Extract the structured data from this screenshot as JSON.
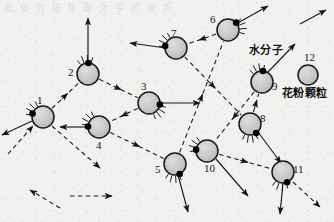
{
  "figure": {
    "background_color": "#f1f1f0",
    "particle_fill": "#c9c9c9",
    "particle_stroke": "#1a1a1a",
    "molecule_color": "#000000",
    "path_style": "dashed",
    "bleed_through_text": "此 处 为 纸 背 面 文 字 的 淡 影"
  },
  "annotations": [
    {
      "id": "water-molecule",
      "text": "水分子",
      "x": 249,
      "y": 45
    },
    {
      "id": "pollen-particle",
      "text": "花粉颗粒",
      "x": 282,
      "y": 88
    }
  ],
  "legend": {
    "pollen_label": "花粉颗粒",
    "pollen_number": "12",
    "water_label": "水分子"
  },
  "chart_data": {
    "type": "scatter",
    "xlabel": "",
    "ylabel": "",
    "xlim": [
      0,
      334
    ],
    "ylim": [
      0,
      222
    ],
    "grid": false,
    "legend_position": "top-right",
    "categories": [
      "1",
      "2",
      "3",
      "4",
      "5",
      "6",
      "7",
      "8",
      "9",
      "10",
      "11",
      "12"
    ],
    "positions": [
      {
        "n": "1",
        "x": 43,
        "y": 117,
        "r": 11,
        "label_dx": -2,
        "label_dy": -16,
        "dot_angle": 198,
        "kick_angle": 215
      },
      {
        "n": "2",
        "x": 88,
        "y": 74,
        "r": 11,
        "label_dx": -16,
        "label_dy": -1,
        "dot_angle": 272,
        "kick_angle": 258
      },
      {
        "n": "3",
        "x": 149,
        "y": 103,
        "r": 11,
        "label_dx": -4,
        "label_dy": -16,
        "dot_angle": 8,
        "kick_angle": 40
      },
      {
        "n": "4",
        "x": 99,
        "y": 127,
        "r": 11,
        "label_dx": 1,
        "label_dy": 19,
        "dot_angle": 182,
        "kick_angle": 215
      },
      {
        "n": "5",
        "x": 175,
        "y": 164,
        "r": 11,
        "label_dx": -16,
        "label_dy": 6,
        "dot_angle": 65,
        "kick_angle": 95
      },
      {
        "n": "6",
        "x": 228,
        "y": 30,
        "r": 11,
        "label_dx": -14,
        "label_dy": -10,
        "dot_angle": 318,
        "kick_angle": 345
      },
      {
        "n": "7",
        "x": 176,
        "y": 48,
        "r": 11,
        "label_dx": -1,
        "label_dy": -14,
        "dot_angle": 190,
        "kick_angle": 212
      },
      {
        "n": "8",
        "x": 250,
        "y": 124,
        "r": 11,
        "label_dx": 14,
        "label_dy": -5,
        "dot_angle": 56,
        "kick_angle": 88
      },
      {
        "n": "9",
        "x": 262,
        "y": 82,
        "r": 11,
        "label_dx": 14,
        "label_dy": 5,
        "dot_angle": 275,
        "kick_angle": 250
      },
      {
        "n": "10",
        "x": 207,
        "y": 151,
        "r": 11,
        "label_dx": 1,
        "label_dy": 18,
        "dot_angle": 187,
        "kick_angle": 205
      },
      {
        "n": "11",
        "x": 283,
        "y": 172,
        "r": 11,
        "label_dx": 14,
        "label_dy": -2,
        "dot_angle": 68,
        "kick_angle": 100
      },
      {
        "n": "12",
        "x": 308,
        "y": 75,
        "r": 10,
        "label_dx": 0,
        "label_dy": -17,
        "dot_angle": null,
        "kick_angle": null
      }
    ],
    "path_order": [
      "1",
      "2",
      "3",
      "4",
      "5",
      "6",
      "7",
      "8",
      "9",
      "10",
      "11"
    ],
    "segments": [
      {
        "from": "1",
        "to": "2"
      },
      {
        "from": "2",
        "to": "3"
      },
      {
        "from": "3",
        "to": "4"
      },
      {
        "from": "4",
        "to": "5"
      },
      {
        "from": "5",
        "to": "6"
      },
      {
        "from": "6",
        "to": "7"
      },
      {
        "from": "7",
        "to": "8"
      },
      {
        "from": "8",
        "to": "9"
      },
      {
        "from": "9",
        "to": "10"
      },
      {
        "from": "10",
        "to": "11"
      }
    ],
    "free_arrows": [
      {
        "id": "tail-into-1",
        "x1": 8,
        "y1": 154,
        "x2": 33,
        "y2": 126
      },
      {
        "id": "out-of-1",
        "x1": 52,
        "y1": 126,
        "x2": 100,
        "y2": 168
      },
      {
        "id": "out-of-11",
        "x1": 293,
        "y1": 182,
        "x2": 320,
        "y2": 207
      },
      {
        "id": "escape-2",
        "x1": 88,
        "y1": 63,
        "x2": 88,
        "y2": 18
      },
      {
        "id": "escape-3",
        "x1": 160,
        "y1": 103,
        "x2": 200,
        "y2": 103
      },
      {
        "id": "escape-6",
        "x1": 236,
        "y1": 24,
        "x2": 268,
        "y2": 6
      },
      {
        "id": "escape-9",
        "x1": 268,
        "y1": 72,
        "x2": 295,
        "y2": 44
      },
      {
        "id": "escape-5",
        "x1": 178,
        "y1": 175,
        "x2": 188,
        "y2": 212
      },
      {
        "id": "escape-4",
        "x1": 88,
        "y1": 127,
        "x2": 60,
        "y2": 127
      },
      {
        "id": "escape-1",
        "x1": 32,
        "y1": 121,
        "x2": 2,
        "y2": 135
      },
      {
        "id": "escape-11",
        "x1": 283,
        "y1": 183,
        "x2": 280,
        "y2": 214
      },
      {
        "id": "escape-8",
        "x1": 258,
        "y1": 132,
        "x2": 281,
        "y2": 163
      },
      {
        "id": "escape-7a",
        "x1": 166,
        "y1": 48,
        "x2": 130,
        "y2": 43
      },
      {
        "id": "escape-10",
        "x1": 216,
        "y1": 159,
        "x2": 248,
        "y2": 196
      },
      {
        "id": "up-right-12",
        "x1": 300,
        "y1": 24,
        "x2": 326,
        "y2": 10
      },
      {
        "id": "bottom-left",
        "x1": 60,
        "y1": 208,
        "x2": 30,
        "y2": 190
      },
      {
        "id": "mid-left-out",
        "x1": 70,
        "y1": 196,
        "x2": 112,
        "y2": 196
      }
    ]
  }
}
